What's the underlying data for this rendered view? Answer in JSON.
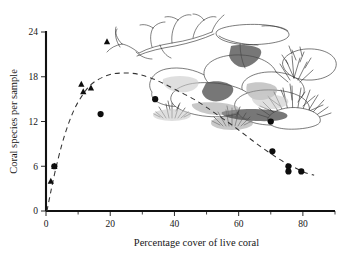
{
  "figure": {
    "illustration_name": "coral-reef-line-drawing",
    "illustration_elements": [
      "branching-staghorn-coral",
      "table-coral",
      "boulder-coral",
      "massive-coral-colony",
      "bushy-branching-coral",
      "encrusting-coral-clump"
    ]
  },
  "chart_data": {
    "type": "scatter",
    "title": "",
    "xlabel": "Percentage cover of live coral",
    "ylabel": "Coral species per sample",
    "xlim": [
      0,
      90
    ],
    "ylim": [
      0,
      24
    ],
    "grid": false,
    "legend": "none",
    "xticks": [
      0,
      20,
      40,
      60,
      80
    ],
    "xtick_labels": [
      "0",
      "20",
      "40",
      "60",
      "80"
    ],
    "xminor_ticks": [
      10,
      30,
      50,
      70,
      90
    ],
    "yticks": [
      0,
      6,
      12,
      18,
      24
    ],
    "ytick_labels": [
      "0",
      "6",
      "12",
      "18",
      "24"
    ],
    "series": [
      {
        "name": "triangles",
        "marker": "triangle",
        "color": "#0d0d0d",
        "points": [
          {
            "x": 1.5,
            "y": 4.0
          },
          {
            "x": 2.6,
            "y": 6.0
          },
          {
            "x": 11.0,
            "y": 17.0
          },
          {
            "x": 11.6,
            "y": 16.0
          },
          {
            "x": 14.0,
            "y": 16.5
          },
          {
            "x": 19.0,
            "y": 22.7
          }
        ]
      },
      {
        "name": "circles",
        "marker": "circle",
        "color": "#0d0d0d",
        "points": [
          {
            "x": 2.6,
            "y": 6.0
          },
          {
            "x": 17.0,
            "y": 13.0
          },
          {
            "x": 34.0,
            "y": 15.0
          },
          {
            "x": 70.0,
            "y": 12.0
          },
          {
            "x": 70.5,
            "y": 8.0
          },
          {
            "x": 75.5,
            "y": 6.0
          },
          {
            "x": 75.5,
            "y": 5.3
          },
          {
            "x": 79.5,
            "y": 5.3
          }
        ]
      }
    ],
    "fitted_curve": {
      "name": "dashed-hump-fit",
      "style": "dashed",
      "color": "#333333",
      "description": "unimodal humped curve peaking near 26% cover",
      "points": [
        {
          "x": 0.3,
          "y": 0.0
        },
        {
          "x": 1.5,
          "y": 2.6
        },
        {
          "x": 3.0,
          "y": 5.6
        },
        {
          "x": 5.0,
          "y": 9.0
        },
        {
          "x": 7.0,
          "y": 11.7
        },
        {
          "x": 9.0,
          "y": 13.8
        },
        {
          "x": 11.0,
          "y": 15.3
        },
        {
          "x": 13.0,
          "y": 16.5
        },
        {
          "x": 15.0,
          "y": 17.3
        },
        {
          "x": 18.0,
          "y": 18.0
        },
        {
          "x": 21.0,
          "y": 18.4
        },
        {
          "x": 24.0,
          "y": 18.5
        },
        {
          "x": 27.0,
          "y": 18.45
        },
        {
          "x": 30.0,
          "y": 18.2
        },
        {
          "x": 34.0,
          "y": 17.6
        },
        {
          "x": 38.0,
          "y": 16.8
        },
        {
          "x": 42.0,
          "y": 15.9
        },
        {
          "x": 46.0,
          "y": 15.0
        },
        {
          "x": 50.0,
          "y": 13.9
        },
        {
          "x": 54.0,
          "y": 12.7
        },
        {
          "x": 58.0,
          "y": 11.5
        },
        {
          "x": 62.0,
          "y": 10.2
        },
        {
          "x": 66.0,
          "y": 8.9
        },
        {
          "x": 70.0,
          "y": 7.7
        },
        {
          "x": 74.0,
          "y": 6.6
        },
        {
          "x": 78.0,
          "y": 5.7
        },
        {
          "x": 81.0,
          "y": 5.1
        },
        {
          "x": 83.5,
          "y": 4.8
        }
      ]
    }
  }
}
